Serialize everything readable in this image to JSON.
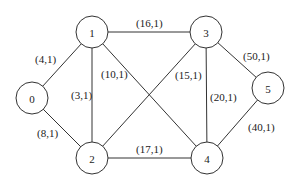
{
  "graph": {
    "nodes": [
      {
        "id": "0",
        "label": "0",
        "x": 32,
        "y": 98
      },
      {
        "id": "1",
        "label": "1",
        "x": 92,
        "y": 32
      },
      {
        "id": "2",
        "label": "2",
        "x": 92,
        "y": 158
      },
      {
        "id": "3",
        "label": "3",
        "x": 206,
        "y": 32
      },
      {
        "id": "4",
        "label": "4",
        "x": 207,
        "y": 158
      },
      {
        "id": "5",
        "label": "5",
        "x": 268,
        "y": 88
      }
    ],
    "edges": [
      {
        "from": "0",
        "to": "1",
        "label": "(4,1)",
        "lx": 35,
        "ly": 63
      },
      {
        "from": "0",
        "to": "2",
        "label": "(8,1)",
        "lx": 37,
        "ly": 137
      },
      {
        "from": "1",
        "to": "3",
        "label": "(16,1)",
        "lx": 136,
        "ly": 27
      },
      {
        "from": "1",
        "to": "2",
        "label": "(3,1)",
        "lx": 71,
        "ly": 99
      },
      {
        "from": "1",
        "to": "4",
        "label": "(10,1)",
        "lx": 101,
        "ly": 78
      },
      {
        "from": "2",
        "to": "3",
        "label": "(15,1)",
        "lx": 175,
        "ly": 79
      },
      {
        "from": "3",
        "to": "4",
        "label": "(20,1)",
        "lx": 210,
        "ly": 101
      },
      {
        "from": "3",
        "to": "5",
        "label": "(50,1)",
        "lx": 243,
        "ly": 60
      },
      {
        "from": "2",
        "to": "4",
        "label": "(17,1)",
        "lx": 136,
        "ly": 153
      },
      {
        "from": "4",
        "to": "5",
        "label": "(40,1)",
        "lx": 248,
        "ly": 131
      }
    ],
    "node_radius": 16,
    "stroke_color": "#333333"
  }
}
